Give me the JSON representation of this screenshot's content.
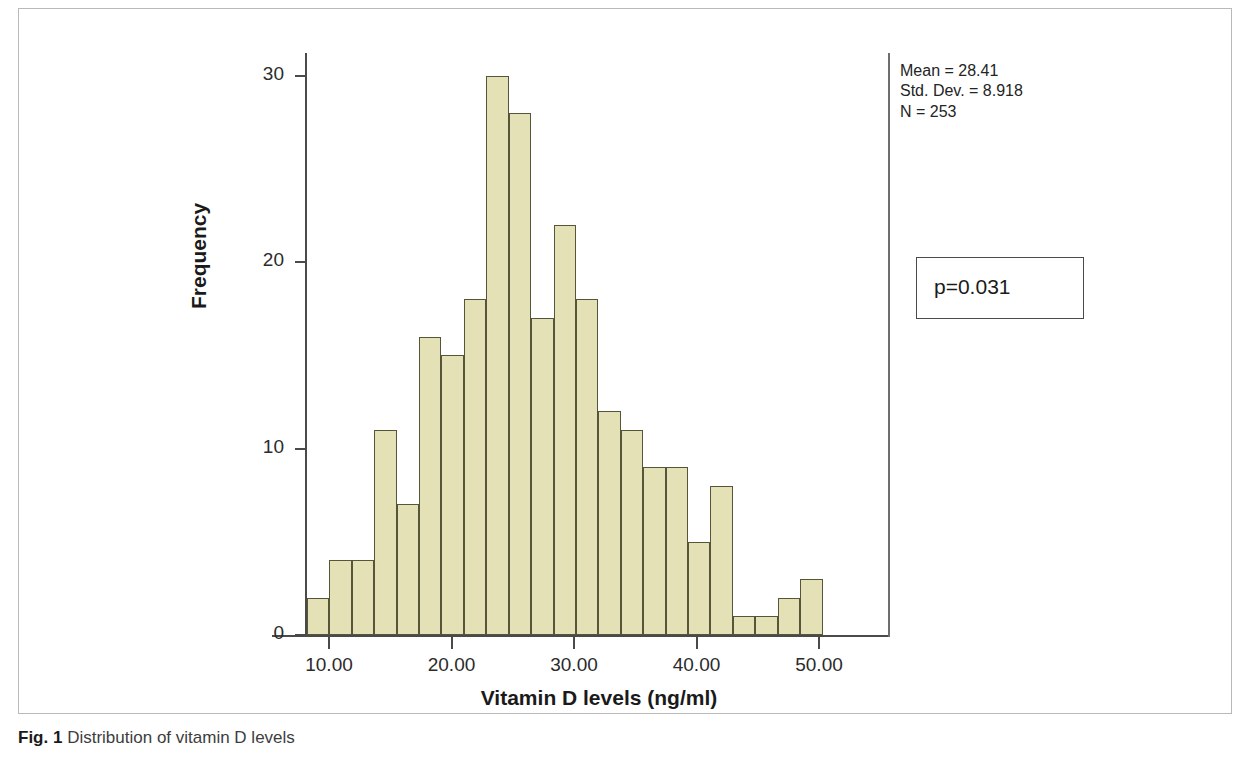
{
  "caption": {
    "label": "Fig. 1",
    "text": "Distribution of vitamin D levels"
  },
  "annotations": {
    "mean_line": "Mean = 28.41",
    "std_line": "Std. Dev. = 8.918",
    "n_line": "N = 253",
    "pvalue": "p=0.031"
  },
  "colors": {
    "bar_fill": "#e4e1b6",
    "bar_stroke": "#55553a",
    "axis": "#4a4a48",
    "frame": "#b9b9b9"
  },
  "chart_data": {
    "type": "bar",
    "title": "Distribution of vitamin D levels",
    "xlabel": "Vitamin D levels (ng/ml)",
    "ylabel": "Frequency",
    "xlim": [
      6.8,
      56.0
    ],
    "ylim": [
      0,
      31
    ],
    "grid": false,
    "legend": null,
    "xticks": [
      10,
      20,
      30,
      40,
      50
    ],
    "xtick_labels": [
      "10.00",
      "20.00",
      "30.00",
      "40.00",
      "50.00"
    ],
    "yticks": [
      0,
      10,
      20,
      30
    ],
    "ytick_labels": [
      "0",
      "10",
      "20",
      "30"
    ],
    "bin_width": 1.83,
    "bin_starts": [
      8.2,
      10.03,
      11.86,
      13.69,
      15.52,
      17.35,
      19.18,
      21.01,
      22.84,
      24.67,
      26.5,
      28.33,
      30.16,
      31.99,
      33.82,
      35.65,
      37.48,
      39.31,
      41.14,
      42.97,
      44.8,
      46.63,
      48.46,
      50.29,
      52.12,
      53.95
    ],
    "bin_centers": [
      9.12,
      10.95,
      12.78,
      14.61,
      16.44,
      18.27,
      20.1,
      21.93,
      23.76,
      25.59,
      27.42,
      29.25,
      31.08,
      32.91,
      34.74,
      36.57,
      38.4,
      40.23,
      42.06,
      43.89,
      45.72,
      47.55,
      49.38,
      51.21,
      53.04,
      54.87
    ],
    "values": [
      2,
      4,
      4,
      11,
      7,
      16,
      15,
      18,
      30,
      28,
      17,
      22,
      18,
      12,
      11,
      9,
      9,
      5,
      8,
      1,
      1,
      2,
      3,
      0,
      0,
      0
    ],
    "statistics": {
      "mean": 28.41,
      "std_dev": 8.918,
      "n": 253,
      "p_value": 0.031
    }
  }
}
